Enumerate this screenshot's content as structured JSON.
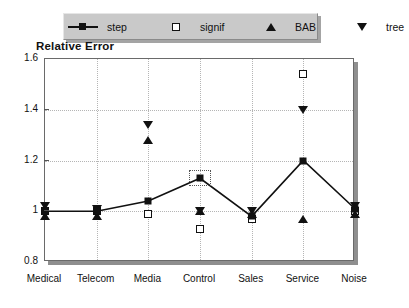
{
  "chart_data": {
    "type": "scatter",
    "title": "Relative Error",
    "xlabel": "",
    "ylabel": "Relative Error",
    "categories": [
      "Medical",
      "Telecom",
      "Media",
      "Control",
      "Sales",
      "Service",
      "Noise"
    ],
    "ylim": [
      0.8,
      1.6
    ],
    "yticks": [
      0.8,
      1.0,
      1.2,
      1.4,
      1.6
    ],
    "ytick_labels": [
      "0.8",
      "1",
      "1.2",
      "1.4",
      "1.6"
    ],
    "grid": true,
    "legend_position": "top",
    "series": [
      {
        "name": "step",
        "marker": "filled-square",
        "line": true,
        "values": [
          1.0,
          1.0,
          1.04,
          1.13,
          0.98,
          1.2,
          1.01
        ]
      },
      {
        "name": "signif",
        "marker": "open-square",
        "line": false,
        "values": [
          1.0,
          1.0,
          0.99,
          0.93,
          0.97,
          1.54,
          1.0
        ]
      },
      {
        "name": "BAB",
        "marker": "triangle-up",
        "line": false,
        "values": [
          0.98,
          0.98,
          1.28,
          1.0,
          0.99,
          0.97,
          0.99
        ]
      },
      {
        "name": "tree",
        "marker": "triangle-down",
        "line": false,
        "values": [
          1.02,
          1.01,
          1.34,
          1.0,
          1.0,
          1.4,
          1.02
        ]
      }
    ],
    "annotations": [
      {
        "kind": "selection-box",
        "series": "step",
        "category": "Control"
      }
    ]
  },
  "legend": {
    "items": [
      {
        "label": "step",
        "icon": "line-with-filled-square-icon"
      },
      {
        "label": "signif",
        "icon": "open-square-icon"
      },
      {
        "label": "BAB",
        "icon": "triangle-up-icon"
      },
      {
        "label": "tree",
        "icon": "triangle-down-icon"
      }
    ]
  },
  "colors": {
    "ink": "#111111",
    "grid": "#b5b5b5",
    "frame": "#6a6a6a",
    "legend_bg": "#c9c9c9",
    "background": "#ffffff"
  }
}
